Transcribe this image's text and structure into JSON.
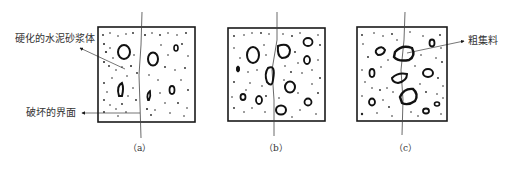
{
  "figure": {
    "panels": [
      {
        "id": "a",
        "caption": "（a）"
      },
      {
        "id": "b",
        "caption": "（b）"
      },
      {
        "id": "c",
        "caption": "（c）"
      }
    ],
    "annotations": {
      "hardened_mortar": "硬化的水泥砂浆体",
      "failure_interface": "破坏的界面",
      "coarse_aggregate": "粗集料"
    }
  },
  "colors": {
    "stroke": "#1a1a1a",
    "background": "#ffffff",
    "text": "#333333"
  }
}
